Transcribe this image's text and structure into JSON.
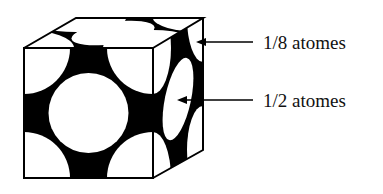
{
  "diagram": {
    "type": "face-centered cubic unit cell",
    "colors": {
      "fill": "#000000",
      "atom": "#ffffff",
      "edge": "#000000"
    },
    "labels": [
      {
        "id": "corner",
        "text": "1/8 atomes",
        "points_to": "corner atom"
      },
      {
        "id": "face",
        "text": "1/2 atomes",
        "points_to": "face-centered atom"
      }
    ]
  }
}
